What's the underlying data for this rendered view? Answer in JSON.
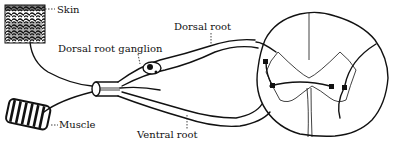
{
  "diagram": {
    "labels": {
      "skin": "Skin",
      "muscle": "Muscle",
      "dorsal_root_ganglion": "Dorsal root ganglion",
      "dorsal_root": "Dorsal root",
      "ventral_root": "Ventral root"
    },
    "colors": {
      "ink": "#111111",
      "background": "#ffffff"
    }
  }
}
